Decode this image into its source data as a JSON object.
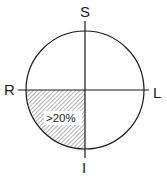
{
  "diagram": {
    "type": "quadrant-circle",
    "axes": {
      "top_label": "S",
      "bottom_label": "I",
      "left_label": "R",
      "right_label": "L"
    },
    "quadrants": [
      {
        "position": "lower-left",
        "shaded": true,
        "pattern": "diagonal-hatch",
        "label": ">20%"
      },
      {
        "position": "upper-left",
        "shaded": false,
        "label": ""
      },
      {
        "position": "upper-right",
        "shaded": false,
        "label": ""
      },
      {
        "position": "lower-right",
        "shaded": false,
        "label": ""
      }
    ],
    "colors": {
      "stroke": "#1a1a1a",
      "background": "#ffffff",
      "hatch": "#555555"
    }
  }
}
